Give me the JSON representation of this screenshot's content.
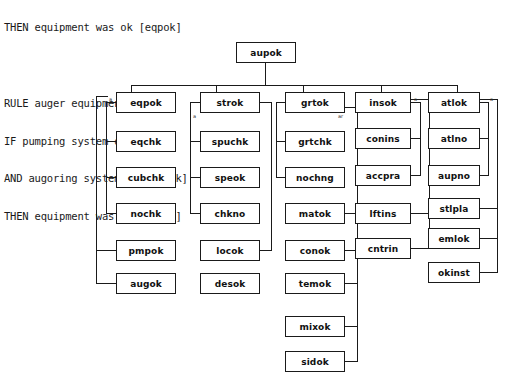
{
  "rule_text": {
    "lines": [
      "THEN equipment was ok [eqpok]",
      "",
      "RULE auger equipment",
      "IF pumping system ok [pmpok]",
      "AND augoring system ok [augok]",
      "THEN equipment was ok [eqpok]"
    ]
  },
  "diagram": {
    "type": "tree",
    "root": {
      "id": "aupok",
      "label": "aupok"
    },
    "columns": [
      {
        "name": "column-1",
        "nodes": [
          {
            "label": "eqpok"
          },
          {
            "label": "eqchk"
          },
          {
            "label": "cubchk"
          },
          {
            "label": "nochk"
          },
          {
            "label": "pmpok"
          },
          {
            "label": "augok"
          }
        ]
      },
      {
        "name": "column-2",
        "nodes": [
          {
            "label": "strok"
          },
          {
            "label": "spuchk"
          },
          {
            "label": "speok"
          },
          {
            "label": "chkno"
          },
          {
            "label": "locok"
          },
          {
            "label": "desok"
          }
        ]
      },
      {
        "name": "column-3",
        "nodes": [
          {
            "label": "grtok"
          },
          {
            "label": "grtchk"
          },
          {
            "label": "nochng"
          },
          {
            "label": "matok"
          },
          {
            "label": "conok"
          },
          {
            "label": "temok"
          },
          {
            "label": "mixok"
          },
          {
            "label": "sidok"
          }
        ]
      },
      {
        "name": "column-4",
        "nodes": [
          {
            "label": "insok"
          },
          {
            "label": "conins"
          },
          {
            "label": "accpra"
          },
          {
            "label": "lftins"
          },
          {
            "label": "cntrin"
          }
        ]
      },
      {
        "name": "column-5",
        "nodes": [
          {
            "label": "atlok"
          },
          {
            "label": "atlno"
          },
          {
            "label": "aupno"
          },
          {
            "label": "stlpla"
          },
          {
            "label": "emlok"
          },
          {
            "label": "okinst"
          }
        ]
      }
    ],
    "markers": [
      {
        "label": "a"
      },
      {
        "label": "a"
      },
      {
        "label": "ar"
      },
      {
        "label": "a"
      },
      {
        "label": "a"
      }
    ]
  }
}
